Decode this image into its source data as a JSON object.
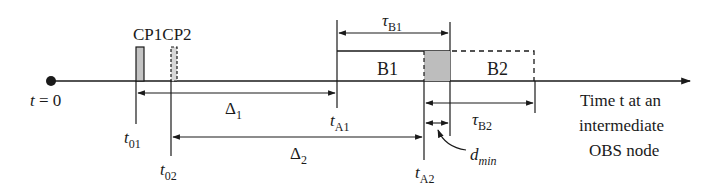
{
  "diagram": {
    "origin_label": "t = 0",
    "control_packets": [
      {
        "label": "CP1",
        "style": "solid",
        "time_label": "t",
        "time_sub": "01"
      },
      {
        "label": "CP2",
        "style": "dashed",
        "time_label": "t",
        "time_sub": "02"
      }
    ],
    "cp_header": "CP1CP2",
    "offsets": [
      {
        "label": "Δ",
        "sub": "1"
      },
      {
        "label": "Δ",
        "sub": "2"
      }
    ],
    "arrivals": [
      {
        "label": "t",
        "sub": "A1"
      },
      {
        "label": "t",
        "sub": "A2"
      }
    ],
    "bursts": [
      {
        "label": "B1",
        "style": "solid",
        "duration_label": "τ",
        "duration_sub": "B1"
      },
      {
        "label": "B2",
        "style": "dashed",
        "duration_label": "τ",
        "duration_sub": "B2"
      }
    ],
    "gap": {
      "label": "d",
      "sub": "min"
    },
    "axis_caption": [
      "Time t at an",
      "intermediate",
      "OBS node"
    ],
    "colors": {
      "line": "#1a1a1a",
      "shade": "#bdbdbd",
      "background": "#ffffff"
    }
  }
}
